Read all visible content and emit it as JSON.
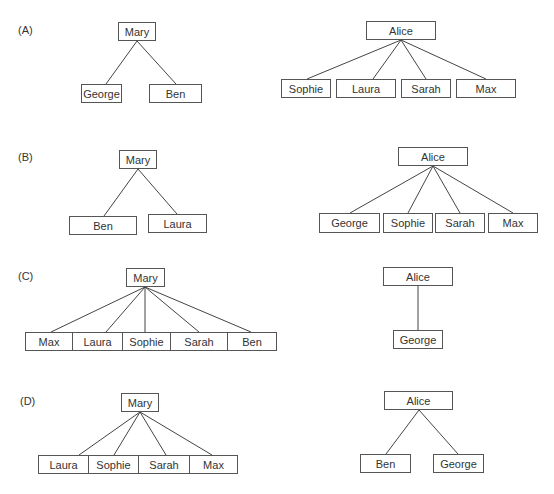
{
  "panels": [
    {
      "label": "(A)",
      "mary": {
        "name": "Mary",
        "children": [
          "George",
          "Ben"
        ]
      },
      "alice": {
        "name": "Alice",
        "children": [
          "Sophie",
          "Laura",
          "Sarah",
          "Max"
        ]
      }
    },
    {
      "label": "(B)",
      "mary": {
        "name": "Mary",
        "children": [
          "Ben",
          "Laura"
        ]
      },
      "alice": {
        "name": "Alice",
        "children": [
          "George",
          "Sophie",
          "Sarah",
          "Max"
        ]
      }
    },
    {
      "label": "(C)",
      "mary": {
        "name": "Mary",
        "children": [
          "Max",
          "Laura",
          "Sophie",
          "Sarah",
          "Ben"
        ]
      },
      "alice": {
        "name": "Alice",
        "children": [
          "George"
        ]
      }
    },
    {
      "label": "(D)",
      "mary": {
        "name": "Mary",
        "children": [
          "Laura",
          "Sophie",
          "Sarah",
          "Max"
        ]
      },
      "alice": {
        "name": "Alice",
        "children": [
          "Ben",
          "George"
        ]
      }
    }
  ]
}
